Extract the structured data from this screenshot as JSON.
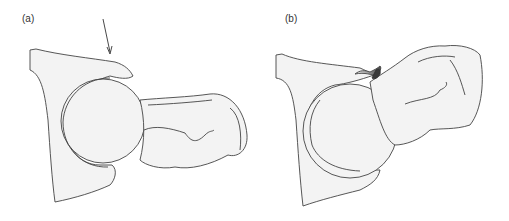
{
  "panels": [
    {
      "label": "(a)",
      "description": "Normal hip joint, arrow indicating acetabular rim"
    },
    {
      "label": "(b)",
      "description": "Hip joint with impingement, shaded labral lesion"
    }
  ],
  "colors": {
    "fill": "#f2f2f2",
    "stroke": "#444444",
    "lesion": "#3a3a3a"
  }
}
